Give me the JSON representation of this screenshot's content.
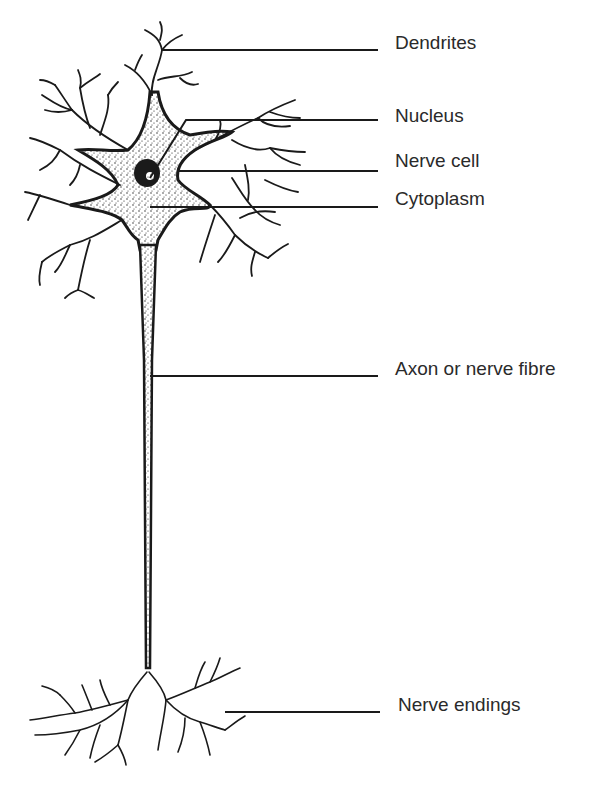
{
  "diagram": {
    "labels": [
      {
        "id": "dendrites",
        "text": "Dendrites"
      },
      {
        "id": "nucleus",
        "text": "Nucleus"
      },
      {
        "id": "nerve-cell",
        "text": "Nerve cell"
      },
      {
        "id": "cytoplasm",
        "text": "Cytoplasm"
      },
      {
        "id": "axon",
        "text": "Axon or nerve fibre"
      },
      {
        "id": "nerve-endings",
        "text": "Nerve endings"
      }
    ],
    "colors": {
      "ink": "#1a1a1a",
      "text": "#2a2a2a",
      "background": "#ffffff"
    }
  }
}
